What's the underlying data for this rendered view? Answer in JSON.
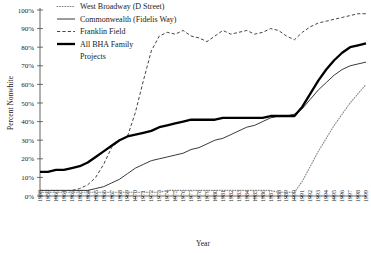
{
  "chart_data": {
    "type": "line",
    "title": "",
    "xlabel": "Year",
    "ylabel": "Percent Nonwhite",
    "ylim": [
      0,
      100
    ],
    "ytick_labels": [
      "0%",
      "10%",
      "20%",
      "30%",
      "40%",
      "50%",
      "60%",
      "70%",
      "80%",
      "90%",
      "100%"
    ],
    "yticks": [
      0,
      10,
      20,
      30,
      40,
      50,
      60,
      70,
      80,
      90,
      100
    ],
    "grid": false,
    "legend_position": "top-left",
    "x": [
      1958,
      1959,
      1960,
      1961,
      1962,
      1963,
      1964,
      1965,
      1966,
      1967,
      1968,
      1969,
      1970,
      1971,
      1972,
      1973,
      1974,
      1975,
      1976,
      1977,
      1978,
      1979,
      1980,
      1981,
      1982,
      1983,
      1984,
      1985,
      1986,
      1987,
      1988,
      1989,
      1990,
      1991,
      1992,
      1993,
      1994,
      1995,
      1996,
      1997,
      1998,
      1999
    ],
    "categories": [
      "1958",
      "1959",
      "1960",
      "1961",
      "1962",
      "1963",
      "1964",
      "1965",
      "1966",
      "1967",
      "1968",
      "1969",
      "1970",
      "1971",
      "1972",
      "1973",
      "1974",
      "1975",
      "1976",
      "1977",
      "1978",
      "1979",
      "1980",
      "1981",
      "1982",
      "1983",
      "1984",
      "1985",
      "1986",
      "1987",
      "1988",
      "1989",
      "1990",
      "1991",
      "1992",
      "1993",
      "1994",
      "1995",
      "1996",
      "1997",
      "1998",
      "1999"
    ],
    "series": [
      {
        "name": "West Broadway (D Street)",
        "style": "dotted",
        "values": [
          2,
          2,
          2,
          2,
          2,
          2,
          2,
          2,
          2,
          2,
          2,
          2,
          2,
          2,
          2,
          2,
          3,
          3,
          3,
          3,
          3,
          3,
          3,
          3,
          3,
          3,
          3,
          3,
          3,
          3,
          2,
          2,
          2,
          8,
          16,
          24,
          31,
          38,
          44,
          50,
          55,
          60
        ]
      },
      {
        "name": "Commonwealth (Fidelis Way)",
        "style": "solid-thin",
        "values": [
          3,
          3,
          3,
          3,
          3,
          3,
          3,
          4,
          5,
          7,
          9,
          12,
          15,
          17,
          19,
          20,
          21,
          22,
          23,
          25,
          26,
          28,
          30,
          31,
          33,
          35,
          37,
          38,
          40,
          42,
          43,
          43,
          44,
          47,
          52,
          57,
          61,
          65,
          68,
          70,
          71,
          72
        ]
      },
      {
        "name": "Franklin Field",
        "style": "dashed",
        "values": [
          3,
          3,
          3,
          3,
          3,
          4,
          6,
          10,
          17,
          26,
          30,
          32,
          45,
          62,
          78,
          86,
          88,
          87,
          89,
          86,
          85,
          83,
          86,
          89,
          87,
          88,
          89,
          87,
          88,
          90,
          89,
          86,
          84,
          88,
          91,
          93,
          94,
          95,
          96,
          97,
          98,
          98
        ]
      },
      {
        "name": "All BHA Family Projects",
        "style": "solid-thick",
        "values": [
          13,
          13,
          14,
          14,
          15,
          16,
          18,
          21,
          24,
          27,
          30,
          32,
          33,
          34,
          35,
          37,
          38,
          39,
          40,
          41,
          41,
          41,
          41,
          42,
          42,
          42,
          42,
          42,
          42,
          43,
          43,
          43,
          43,
          48,
          55,
          62,
          68,
          73,
          77,
          80,
          81,
          82
        ]
      }
    ]
  },
  "legend": {
    "items": [
      {
        "label": "West Broadway (D Street)"
      },
      {
        "label": "Commonwealth (Fidelis Way)"
      },
      {
        "label": "Franklin Field"
      },
      {
        "label": "All BHA Family"
      },
      {
        "label": "Projects"
      }
    ]
  }
}
